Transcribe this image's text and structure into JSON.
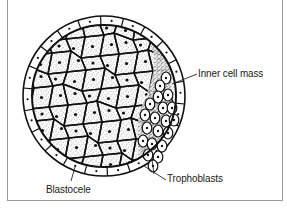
{
  "figure": {
    "colors": {
      "ink": "#111111",
      "stipple": "#2a2a2a",
      "frame": "#9a9a9a",
      "background": "#ffffff"
    },
    "labels": [
      {
        "id": "inner_cell_mass",
        "text": "Inner cell mass"
      },
      {
        "id": "trophoblasts",
        "text": "Trophoblasts"
      },
      {
        "id": "blastocele",
        "text": "Blastocele"
      }
    ]
  },
  "labels": {
    "inner_cell_mass": "Inner cell mass",
    "trophoblasts": "Trophoblasts",
    "blastocele": "Blastocele"
  }
}
